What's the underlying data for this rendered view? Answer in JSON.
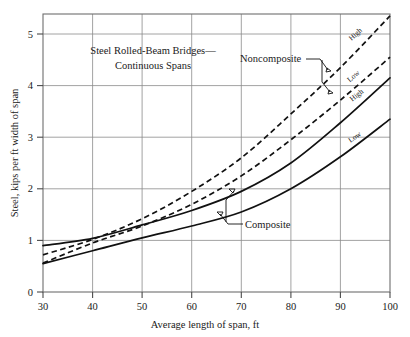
{
  "chart_data": {
    "type": "line",
    "title_line1": "Steel Rolled-Beam Bridges—",
    "title_line2": "Continuous Spans",
    "xlabel": "Average length of span, ft",
    "ylabel": "Steel, kips per ft width of span",
    "xlim": [
      30,
      100
    ],
    "ylim": [
      0,
      5.4
    ],
    "xticks": [
      30,
      40,
      50,
      60,
      70,
      80,
      90,
      100
    ],
    "xtick_labels": [
      "30",
      "40",
      "50",
      "60",
      "70",
      "80",
      "90",
      "100"
    ],
    "yticks": [
      0,
      1,
      2,
      3,
      4,
      5
    ],
    "ytick_labels": [
      "0",
      "1",
      "2",
      "3",
      "4",
      "5"
    ],
    "grid": true,
    "grid_axes": "both",
    "legend_position": "inline-annotations",
    "annotations": [
      {
        "text": "Noncomposite",
        "x": 72,
        "y": 4.45,
        "points_to": "dashed-high, dashed-low"
      },
      {
        "text": "Composite",
        "x": 76,
        "y": 1.22,
        "points_to": "solid-high, solid-low"
      }
    ],
    "x": [
      30,
      40,
      50,
      60,
      70,
      80,
      90,
      100
    ],
    "series": [
      {
        "name": "Noncomposite High",
        "label": "High",
        "group": "Noncomposite",
        "style": "dashed",
        "values": [
          0.72,
          1.02,
          1.42,
          1.95,
          2.6,
          3.45,
          4.35,
          5.35
        ]
      },
      {
        "name": "Noncomposite Low",
        "label": "Low",
        "group": "Noncomposite",
        "style": "dashed",
        "values": [
          0.56,
          0.95,
          1.28,
          1.7,
          2.25,
          2.95,
          3.72,
          4.55
        ]
      },
      {
        "name": "Composite High",
        "label": "High",
        "group": "Composite",
        "style": "solid",
        "values": [
          0.9,
          1.04,
          1.3,
          1.58,
          1.95,
          2.5,
          3.28,
          4.15
        ]
      },
      {
        "name": "Composite Low",
        "label": "Low",
        "group": "Composite",
        "style": "solid",
        "values": [
          0.55,
          0.8,
          1.05,
          1.28,
          1.55,
          2.0,
          2.62,
          3.35
        ]
      }
    ],
    "curve_labels": [
      {
        "text": "High",
        "series": "Noncomposite High"
      },
      {
        "text": "Low",
        "series": "Noncomposite Low"
      },
      {
        "text": "High",
        "series": "Composite High"
      },
      {
        "text": "Low",
        "series": "Composite Low"
      }
    ]
  }
}
